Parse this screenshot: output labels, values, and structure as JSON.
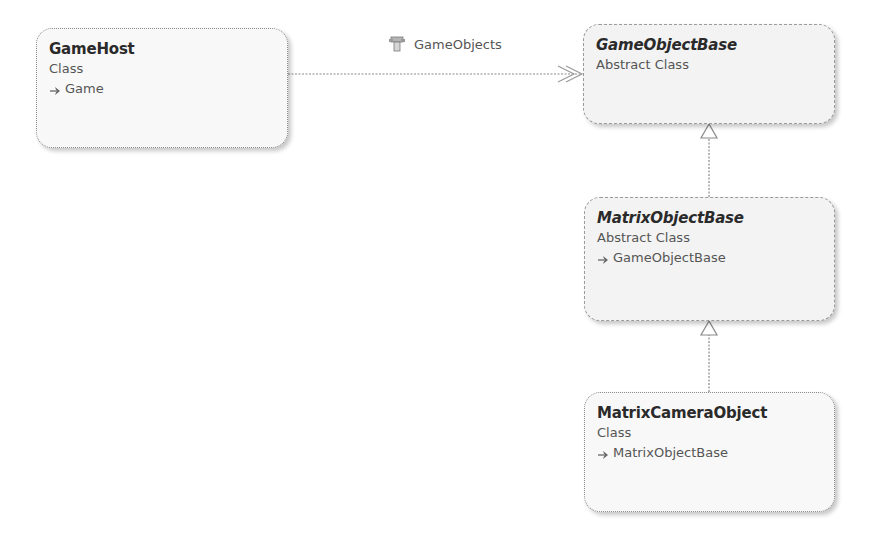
{
  "diagram": {
    "type": "class-diagram",
    "shapes": [
      {
        "id": "gamehost",
        "name": "GameHost",
        "kind": "Class",
        "base": "Game",
        "abstract": false
      },
      {
        "id": "gameobjectbase",
        "name": "GameObjectBase",
        "kind": "Abstract Class",
        "base": null,
        "abstract": true
      },
      {
        "id": "matrixobjectbase",
        "name": "MatrixObjectBase",
        "kind": "Abstract Class",
        "base": "GameObjectBase",
        "abstract": true
      },
      {
        "id": "matrixcameraobject",
        "name": "MatrixCameraObject",
        "kind": "Class",
        "base": "MatrixObjectBase",
        "abstract": false
      }
    ],
    "associations": [
      {
        "from": "GameHost",
        "to": "GameObjectBase",
        "label": "GameObjects",
        "icon": "property-icon",
        "style": "collection-association"
      }
    ],
    "inheritance": [
      {
        "child": "MatrixObjectBase",
        "parent": "GameObjectBase"
      },
      {
        "child": "MatrixCameraObject",
        "parent": "MatrixObjectBase"
      }
    ]
  },
  "colors": {
    "line": "#8a8a8a",
    "shape_fill": "#f7f7f7",
    "text_primary": "#2a2a2a",
    "text_secondary": "#555555"
  }
}
